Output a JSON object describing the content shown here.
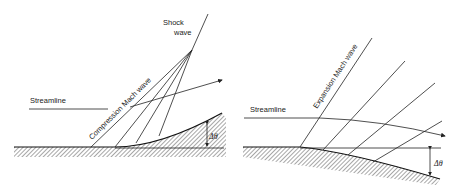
{
  "figure": {
    "left_panel": {
      "title": "Compression",
      "labels": {
        "shock": "Shock",
        "shock2": "wave",
        "streamline": "Streamline",
        "mach_wave": "Compression  Mach wave",
        "angle": "Δθ"
      }
    },
    "right_panel": {
      "title": "Expansion",
      "labels": {
        "streamline": "Streamline",
        "mach_wave": "Expansion Mach wave",
        "angle": "Δθ"
      }
    }
  }
}
